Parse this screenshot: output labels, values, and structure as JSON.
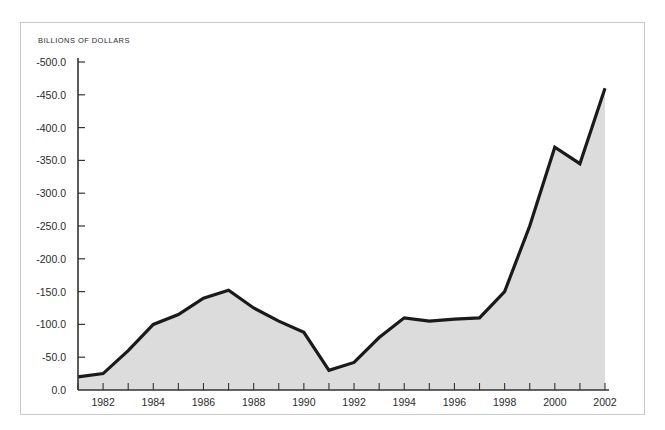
{
  "figure": {
    "axis_title": "BILLIONS OF DOLLARS",
    "frame_color": "#c9c9c9",
    "background": "#ffffff"
  },
  "chart_data": {
    "type": "area",
    "title": "",
    "subtitle": "",
    "xlabel": "",
    "ylabel": "BILLIONS OF DOLLARS",
    "grid": false,
    "legend": "none",
    "y_inverted": true,
    "ylim": [
      0.0,
      -500.0
    ],
    "xlim": [
      1981,
      2002
    ],
    "y_ticks": [
      0.0,
      -50.0,
      -100.0,
      -150.0,
      -200.0,
      -250.0,
      -300.0,
      -350.0,
      -400.0,
      -450.0,
      -500.0
    ],
    "y_tick_labels": [
      "0.0",
      "-50.0",
      "-100.0",
      "-150.0",
      "-200.0",
      "-250.0",
      "-300.0",
      "-350.0",
      "-400.0",
      "-450.0",
      "-500.0"
    ],
    "x_ticks": [
      1981,
      1982,
      1983,
      1984,
      1985,
      1986,
      1987,
      1988,
      1989,
      1990,
      1991,
      1992,
      1993,
      1994,
      1995,
      1996,
      1997,
      1998,
      1999,
      2000,
      2001,
      2002
    ],
    "x_tick_labels_shown": [
      "1982",
      "1984",
      "1986",
      "1988",
      "1990",
      "1992",
      "1994",
      "1996",
      "1998",
      "2000",
      "2002"
    ],
    "x_labeled_values": [
      1982,
      1984,
      1986,
      1988,
      1990,
      1992,
      1994,
      1996,
      1998,
      2000,
      2002
    ],
    "line_color": "#1a1a1a",
    "line_width": 3.2,
    "fill_color": "#dcdcdc",
    "x": [
      1981,
      1982,
      1983,
      1984,
      1985,
      1986,
      1987,
      1988,
      1989,
      1990,
      1991,
      1992,
      1993,
      1994,
      1995,
      1996,
      1997,
      1998,
      1999,
      2000,
      2001,
      2002
    ],
    "values": [
      -20,
      -25,
      -60,
      -100,
      -115,
      -140,
      -152,
      -125,
      -105,
      -88,
      -30,
      -42,
      -80,
      -110,
      -105,
      -108,
      -110,
      -150,
      -250,
      -370,
      -345,
      -460
    ],
    "series": [
      {
        "name": "Budget deficit",
        "values": [
          -20,
          -25,
          -60,
          -100,
          -115,
          -140,
          -152,
          -125,
          -105,
          -88,
          -30,
          -42,
          -80,
          -110,
          -105,
          -108,
          -110,
          -150,
          -250,
          -370,
          -345,
          -460
        ]
      }
    ]
  }
}
